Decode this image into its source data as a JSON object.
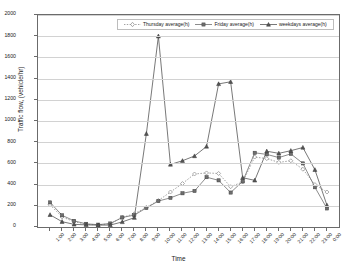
{
  "chart_data": {
    "type": "line",
    "title": "",
    "xlabel": "Time",
    "ylabel": "Traffic flow, (vehicle/hr)",
    "ylim": [
      0,
      2000
    ],
    "ytick_step": 200,
    "yticks": [
      0,
      200,
      400,
      600,
      800,
      1000,
      1200,
      1400,
      1600,
      1800,
      2000
    ],
    "grid": true,
    "legend_position": "top-center",
    "categories": [
      "1:00",
      "2:00",
      "3:00",
      "4:00",
      "5:00",
      "6:00",
      "7:00",
      "8:00",
      "9:00",
      "10:00",
      "11:00",
      "12:00",
      "13:00",
      "14:00",
      "15:00",
      "16:00",
      "17:00",
      "18:00",
      "19:00",
      "20:00",
      "21:00",
      "22:00",
      "23:00",
      "0:00"
    ],
    "series": [
      {
        "name": "Thursday average(h)",
        "marker": "diamond",
        "line_style": "dotted",
        "color": "#8a8a8a",
        "values": [
          210,
          95,
          50,
          25,
          20,
          30,
          90,
          125,
          185,
          250,
          330,
          410,
          500,
          510,
          505,
          380,
          425,
          660,
          645,
          610,
          625,
          545,
          400,
          330
        ]
      },
      {
        "name": "Friday average(h)",
        "marker": "square",
        "line_style": "solid",
        "color": "#6e6e6e",
        "values": [
          232,
          110,
          58,
          30,
          22,
          33,
          90,
          112,
          180,
          245,
          275,
          318,
          340,
          470,
          440,
          325,
          430,
          700,
          685,
          655,
          690,
          600,
          375,
          175
        ]
      },
      {
        "name": "weekdays average(h)",
        "marker": "triangle",
        "line_style": "solid",
        "color": "#555555",
        "values": [
          115,
          50,
          25,
          20,
          18,
          18,
          48,
          88,
          110,
          880,
          1800,
          590,
          625,
          670,
          760,
          1350,
          1370,
          465,
          440,
          715,
          695,
          720,
          750,
          205
        ]
      }
    ],
    "weekdays_plot_values": [
      115,
      50,
      25,
      20,
      18,
      18,
      48,
      88,
      880,
      1800,
      590,
      625,
      670,
      760,
      1350,
      1370,
      465,
      440,
      715,
      695,
      720,
      750,
      540,
      205
    ]
  },
  "legend": {
    "entries": [
      {
        "label": "Thursday average(h)"
      },
      {
        "label": "Friday average(h)"
      },
      {
        "label": "weekdays average(h)"
      }
    ]
  },
  "axes": {
    "y_title": "Traffic flow, (vehicle/hr)",
    "x_title": "Time",
    "y_labels": [
      "2000",
      "1800",
      "1600",
      "1400",
      "1200",
      "1000",
      "800",
      "600",
      "400",
      "200",
      "0"
    ],
    "x_labels": [
      "1:00",
      "2:00",
      "3:00",
      "4:00",
      "5:00",
      "6:00",
      "7:00",
      "8:00",
      "9:00",
      "10:00",
      "11:00",
      "12:00",
      "13:00",
      "14:00",
      "15:00",
      "16:00",
      "17:00",
      "18:00",
      "19:00",
      "20:00",
      "21:00",
      "22:00",
      "23:00",
      "0:00"
    ]
  }
}
